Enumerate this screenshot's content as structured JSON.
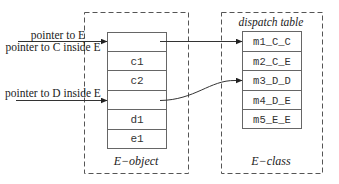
{
  "diagram": {
    "type": "object-layout-dispatch",
    "e_object": {
      "caption": "E−object",
      "slots": [
        "",
        "c1",
        "c2",
        "",
        "d1",
        "e1"
      ]
    },
    "e_class": {
      "caption": "E−class",
      "table_title": "dispatch table",
      "entries": [
        "m1_C_C",
        "m2_C_E",
        "m3_D_D",
        "m4_D_E",
        "m5_E_E"
      ]
    },
    "pointers": [
      {
        "label_above": "pointer to E",
        "label_below": "pointer to C inside E",
        "target_slot": 0
      },
      {
        "label_above": "pointer to D inside E",
        "target_slot": 3
      }
    ],
    "links": [
      {
        "from_slot": 0,
        "to_entry": 0
      },
      {
        "from_slot": 3,
        "to_entry": 2
      }
    ],
    "colors": {
      "line": "#333333",
      "dashed": "#555555",
      "cell_border": "#666666"
    }
  }
}
